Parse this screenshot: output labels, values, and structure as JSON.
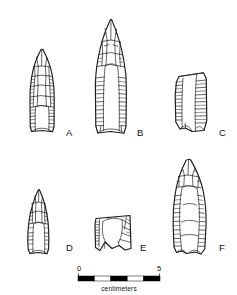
{
  "figure": {
    "type": "archaeological-line-drawing",
    "background_color": "#ffffff",
    "ink_color": "#1a1a1a",
    "width": 237,
    "height": 295
  },
  "specimens": [
    {
      "id": "A",
      "label": "A",
      "description": "lanceolate fluted point, complete, concave base",
      "label_x": 66,
      "label_y": 133
    },
    {
      "id": "B",
      "label": "B",
      "description": "large elongate fluted point, long flute channel, concave base",
      "label_x": 137,
      "label_y": 133
    },
    {
      "id": "C",
      "label": "C",
      "description": "basal and midsection fragment, broken point",
      "label_x": 219,
      "label_y": 133
    },
    {
      "id": "D",
      "label": "D",
      "description": "small triangular fluted point, concave base",
      "label_x": 66,
      "label_y": 248
    },
    {
      "id": "E",
      "label": "E",
      "description": "basal fragment with concave base and flute remnant",
      "label_x": 140,
      "label_y": 248
    },
    {
      "id": "F",
      "label": "F",
      "description": "lanceolate fluted point with broad flute, concave base",
      "label_x": 219,
      "label_y": 248
    }
  ],
  "scale_bar": {
    "unit_caption": "centimeters",
    "min_label": "0",
    "max_label": "5",
    "min_value": 0,
    "max_value": 5,
    "segments": 5,
    "segment_colors": [
      "#000000",
      "#ffffff",
      "#000000",
      "#ffffff",
      "#000000"
    ],
    "bar_left": 78,
    "bar_right": 160,
    "bar_top": 276,
    "bar_height": 5,
    "caption_x": 119,
    "caption_y": 291,
    "min_label_x": 79,
    "max_label_x": 159,
    "label_y": 271
  }
}
